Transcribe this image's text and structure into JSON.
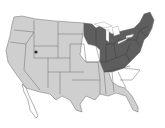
{
  "map": {
    "title": "",
    "region": "Contiguous United States",
    "colors": {
      "default_state": "#cfcfcf",
      "highlighted_state": "#5e5e5e",
      "border": "#6a6a6a",
      "background": "#ffffff"
    },
    "highlighted_states": [
      "Minnesota",
      "Wisconsin",
      "Michigan",
      "Indiana",
      "Ohio",
      "Kentucky",
      "Tennessee",
      "West Virginia",
      "Virginia",
      "Pennsylvania",
      "New York",
      "Maryland",
      "Delaware",
      "New Jersey",
      "Connecticut",
      "Rhode Island",
      "Massachusetts",
      "Vermont",
      "New Hampshire",
      "Maine"
    ],
    "features": [
      "Great Salt Lake marker",
      "Great Lakes",
      "Baja California outline"
    ]
  }
}
